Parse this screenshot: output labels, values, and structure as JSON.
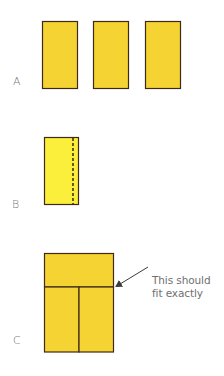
{
  "figure": {
    "width": 224,
    "height": 376,
    "colors": {
      "fill_gold": "#F5D332",
      "fill_bright_yellow": "#FBEF3C",
      "stroke": "#3f2a1a",
      "label_text": "#7a7a7a",
      "annotation_text": "#6f6f6f",
      "arrow": "#3a3a3a",
      "background": "#ffffff"
    },
    "panels": [
      {
        "id": "A",
        "label": "A",
        "description": "Three identical upright rectangles side by side",
        "shapes": [
          {
            "type": "rect",
            "x": 42,
            "y": 21,
            "w": 35,
            "h": 67,
            "fill": "gold"
          },
          {
            "type": "rect",
            "x": 93,
            "y": 21,
            "w": 35,
            "h": 67,
            "fill": "gold"
          },
          {
            "type": "rect",
            "x": 145,
            "y": 21,
            "w": 35,
            "h": 67,
            "fill": "gold"
          }
        ]
      },
      {
        "id": "B",
        "label": "B",
        "description": "Single rectangle with a dashed vertical fold line near the right edge",
        "shapes": [
          {
            "type": "rect",
            "x": 44,
            "y": 137,
            "w": 35,
            "h": 67,
            "fill": "bright_yellow"
          },
          {
            "type": "dashed-line",
            "x1": 73,
            "y1": 137,
            "x2": 73,
            "y2": 204
          }
        ]
      },
      {
        "id": "C",
        "label": "C",
        "description": "Rectangle laid horizontally on top of two upright rectangles",
        "shapes": [
          {
            "type": "rect",
            "x": 44,
            "y": 253,
            "w": 70,
            "h": 34,
            "fill": "gold"
          },
          {
            "type": "rect",
            "x": 44,
            "y": 287,
            "w": 35,
            "h": 65,
            "fill": "gold"
          },
          {
            "type": "rect",
            "x": 79,
            "y": 287,
            "w": 35,
            "h": 65,
            "fill": "gold"
          }
        ],
        "annotation": {
          "line1": "This should",
          "line2": "fit exactly",
          "arrow": {
            "x1": 148,
            "y1": 267,
            "x2": 115,
            "y2": 287
          }
        }
      }
    ]
  }
}
